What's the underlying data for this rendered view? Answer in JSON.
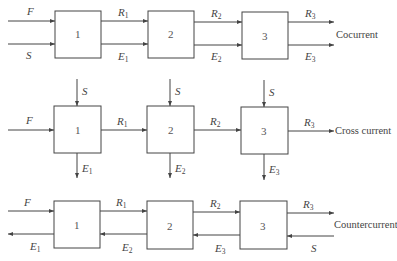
{
  "diagram": {
    "rows": [
      {
        "mode_label": "Cocurrent",
        "stages": [
          "1",
          "2",
          "3"
        ],
        "inputs": {
          "feed": "F",
          "solvent": "S"
        },
        "streams_top": [
          {
            "base": "R",
            "sub": "1"
          },
          {
            "base": "R",
            "sub": "2"
          },
          {
            "base": "R",
            "sub": "3"
          }
        ],
        "streams_bottom": [
          {
            "base": "E",
            "sub": "1"
          },
          {
            "base": "E",
            "sub": "2"
          },
          {
            "base": "E",
            "sub": "3"
          }
        ]
      },
      {
        "mode_label": "Cross current",
        "stages": [
          "1",
          "2",
          "3"
        ],
        "inputs": {
          "feed": "F",
          "solvent": [
            "S",
            "S",
            "S"
          ]
        },
        "streams_top": [
          {
            "base": "R",
            "sub": "1"
          },
          {
            "base": "R",
            "sub": "2"
          },
          {
            "base": "R",
            "sub": "3"
          }
        ],
        "streams_bottom": [
          {
            "base": "E",
            "sub": "1"
          },
          {
            "base": "E",
            "sub": "2"
          },
          {
            "base": "E",
            "sub": "3"
          }
        ]
      },
      {
        "mode_label": "Countercurrent",
        "stages": [
          "1",
          "2",
          "3"
        ],
        "inputs": {
          "feed": "F",
          "solvent": "S"
        },
        "streams_top": [
          {
            "base": "R",
            "sub": "1"
          },
          {
            "base": "R",
            "sub": "2"
          },
          {
            "base": "R",
            "sub": "3"
          }
        ],
        "streams_bottom": [
          {
            "base": "E",
            "sub": "1"
          },
          {
            "base": "E",
            "sub": "2"
          },
          {
            "base": "E",
            "sub": "3"
          }
        ]
      }
    ]
  }
}
